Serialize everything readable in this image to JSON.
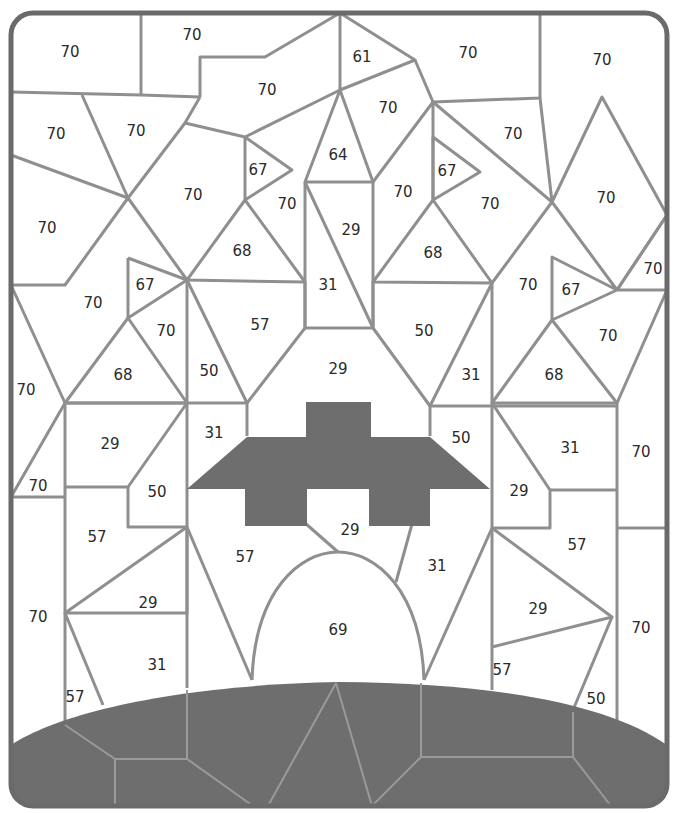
{
  "puzzle": {
    "type": "color-by-number",
    "subject": "spaceship",
    "colors": {
      "line": "#8f8f8f",
      "frame": "#6a6a6a",
      "shaded": "#6e6e6e",
      "background": "#ffffff"
    },
    "labels": [
      {
        "id": "r1",
        "value": "70",
        "x": 70,
        "y": 52
      },
      {
        "id": "r2",
        "value": "70",
        "x": 192,
        "y": 35
      },
      {
        "id": "r3",
        "value": "61",
        "x": 362,
        "y": 57
      },
      {
        "id": "r4",
        "value": "70",
        "x": 468,
        "y": 53
      },
      {
        "id": "r5",
        "value": "70",
        "x": 602,
        "y": 60
      },
      {
        "id": "r6",
        "value": "70",
        "x": 267,
        "y": 90
      },
      {
        "id": "r7",
        "value": "70",
        "x": 56,
        "y": 134
      },
      {
        "id": "r8",
        "value": "70",
        "x": 136,
        "y": 131
      },
      {
        "id": "r9",
        "value": "70",
        "x": 388,
        "y": 108
      },
      {
        "id": "r10",
        "value": "70",
        "x": 513,
        "y": 134
      },
      {
        "id": "r11",
        "value": "64",
        "x": 338,
        "y": 155
      },
      {
        "id": "r12",
        "value": "67",
        "x": 258,
        "y": 170
      },
      {
        "id": "r13",
        "value": "67",
        "x": 447,
        "y": 171
      },
      {
        "id": "r14",
        "value": "70",
        "x": 193,
        "y": 195
      },
      {
        "id": "r15",
        "value": "70",
        "x": 287,
        "y": 204
      },
      {
        "id": "r16",
        "value": "70",
        "x": 403,
        "y": 192
      },
      {
        "id": "r17",
        "value": "70",
        "x": 490,
        "y": 204
      },
      {
        "id": "r18",
        "value": "70",
        "x": 606,
        "y": 198
      },
      {
        "id": "r19",
        "value": "70",
        "x": 47,
        "y": 228
      },
      {
        "id": "r20",
        "value": "29",
        "x": 351,
        "y": 230
      },
      {
        "id": "r21",
        "value": "68",
        "x": 242,
        "y": 251
      },
      {
        "id": "r22",
        "value": "68",
        "x": 433,
        "y": 253
      },
      {
        "id": "r23",
        "value": "70",
        "x": 653,
        "y": 269
      },
      {
        "id": "r24",
        "value": "67",
        "x": 145,
        "y": 285
      },
      {
        "id": "r25",
        "value": "31",
        "x": 328,
        "y": 285
      },
      {
        "id": "r26",
        "value": "70",
        "x": 528,
        "y": 285
      },
      {
        "id": "r27",
        "value": "67",
        "x": 571,
        "y": 290
      },
      {
        "id": "r28",
        "value": "70",
        "x": 93,
        "y": 303
      },
      {
        "id": "r29",
        "value": "57",
        "x": 260,
        "y": 325
      },
      {
        "id": "r30",
        "value": "50",
        "x": 424,
        "y": 331
      },
      {
        "id": "r31",
        "value": "70",
        "x": 166,
        "y": 331
      },
      {
        "id": "r32",
        "value": "70",
        "x": 608,
        "y": 336
      },
      {
        "id": "r33",
        "value": "68",
        "x": 123,
        "y": 375
      },
      {
        "id": "r34",
        "value": "50",
        "x": 209,
        "y": 371
      },
      {
        "id": "r35",
        "value": "29",
        "x": 338,
        "y": 369
      },
      {
        "id": "r36",
        "value": "31",
        "x": 471,
        "y": 375
      },
      {
        "id": "r37",
        "value": "68",
        "x": 554,
        "y": 375
      },
      {
        "id": "r38",
        "value": "70",
        "x": 26,
        "y": 390
      },
      {
        "id": "r39",
        "value": "31",
        "x": 214,
        "y": 433
      },
      {
        "id": "r40",
        "value": "29",
        "x": 110,
        "y": 444
      },
      {
        "id": "r41",
        "value": "50",
        "x": 461,
        "y": 438
      },
      {
        "id": "r42",
        "value": "31",
        "x": 570,
        "y": 448
      },
      {
        "id": "r43",
        "value": "70",
        "x": 641,
        "y": 452
      },
      {
        "id": "r44",
        "value": "70",
        "x": 38,
        "y": 486
      },
      {
        "id": "r45",
        "value": "50",
        "x": 157,
        "y": 492
      },
      {
        "id": "r46",
        "value": "29",
        "x": 519,
        "y": 491
      },
      {
        "id": "r47",
        "value": "29",
        "x": 350,
        "y": 530
      },
      {
        "id": "r48",
        "value": "57",
        "x": 97,
        "y": 537
      },
      {
        "id": "r49",
        "value": "57",
        "x": 245,
        "y": 557
      },
      {
        "id": "r50",
        "value": "57",
        "x": 577,
        "y": 545
      },
      {
        "id": "r51",
        "value": "31",
        "x": 437,
        "y": 566
      },
      {
        "id": "r52",
        "value": "29",
        "x": 148,
        "y": 603
      },
      {
        "id": "r53",
        "value": "29",
        "x": 538,
        "y": 609
      },
      {
        "id": "r54",
        "value": "70",
        "x": 38,
        "y": 617
      },
      {
        "id": "r55",
        "value": "69",
        "x": 338,
        "y": 630
      },
      {
        "id": "r56",
        "value": "70",
        "x": 641,
        "y": 628
      },
      {
        "id": "r57",
        "value": "31",
        "x": 157,
        "y": 665
      },
      {
        "id": "r58",
        "value": "57",
        "x": 502,
        "y": 670
      },
      {
        "id": "r59",
        "value": "57",
        "x": 75,
        "y": 697
      },
      {
        "id": "r60",
        "value": "50",
        "x": 596,
        "y": 699
      }
    ]
  }
}
